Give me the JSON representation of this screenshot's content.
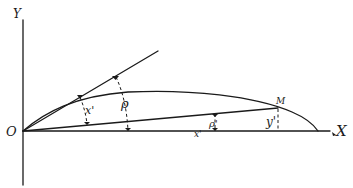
{
  "diagram": {
    "type": "geometric-construction",
    "labels": {
      "y_axis": "Y",
      "x_axis": "X",
      "origin": "O",
      "point_m": "M",
      "angle_x_prime": "x'",
      "rho": "ρ",
      "rho_prime": "ρ'",
      "x_prime_lower": "x'",
      "y_prime": "y'"
    },
    "colors": {
      "stroke": "#1a1a1a",
      "background": "#ffffff"
    }
  }
}
